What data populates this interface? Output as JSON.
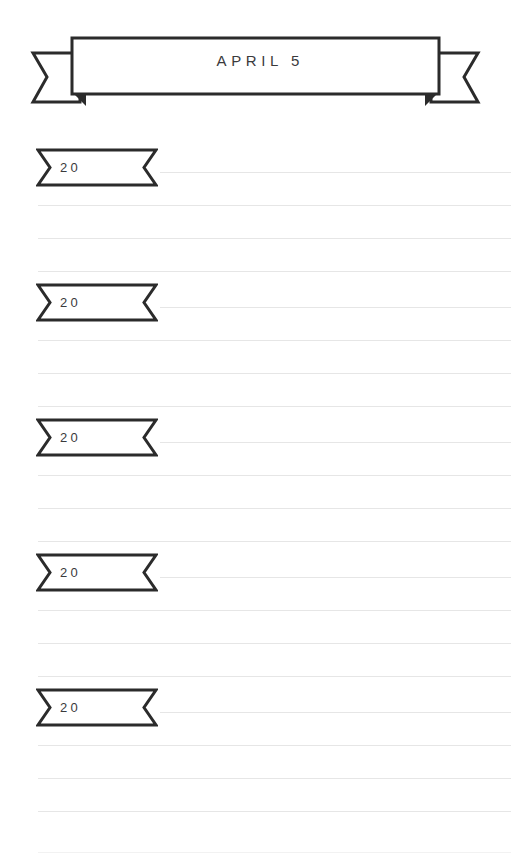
{
  "page": {
    "width": 511,
    "height": 860,
    "background_color": "#ffffff",
    "ink_color": "#2b2b2b",
    "text_color": "#3a3a3c",
    "rule_color": "#e6e6e6"
  },
  "header": {
    "title": "APRIL 5",
    "shape": "ribbon-banner",
    "icon": "ribbon-banner-icon"
  },
  "sections": [
    {
      "year_label": "20",
      "top": 148,
      "rules": [
        172,
        205,
        238,
        271
      ]
    },
    {
      "year_label": "20",
      "top": 283,
      "rules": [
        307,
        340,
        373,
        406
      ]
    },
    {
      "year_label": "20",
      "top": 418,
      "rules": [
        442,
        475,
        508,
        541
      ]
    },
    {
      "year_label": "20",
      "top": 553,
      "rules": [
        577,
        610,
        643,
        676
      ]
    },
    {
      "year_label": "20",
      "top": 688,
      "rules": [
        712,
        745,
        778,
        811
      ]
    }
  ],
  "footer": {
    "trailing_rule_y": 852
  }
}
